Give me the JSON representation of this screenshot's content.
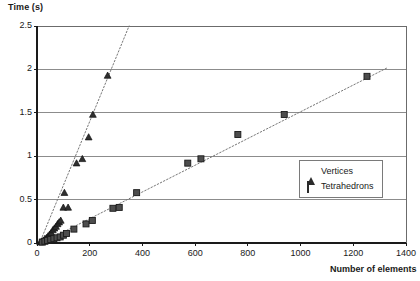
{
  "chart_data": {
    "type": "scatter",
    "title": "",
    "xlabel": "Number of elements",
    "ylabel": "Time (s)",
    "xlim": [
      0,
      1400
    ],
    "ylim": [
      0,
      2.5
    ],
    "xticks": [
      0,
      200,
      400,
      600,
      800,
      1000,
      1200,
      1400
    ],
    "yticks": [
      0,
      0.5,
      1,
      1.5,
      2,
      2.5
    ],
    "xtick_labels": [
      "0",
      "200",
      "400",
      "600",
      "800",
      "1000",
      "1200",
      "1400"
    ],
    "ytick_labels": [
      "0",
      "0.5",
      "1",
      "1.5",
      "2",
      "2.5"
    ],
    "grid": "horizontal",
    "legend_position": "lower-right-inside",
    "series": [
      {
        "name": "Vertices",
        "marker": "triangle",
        "color": "#2b2b2b",
        "trendline": "dotted",
        "trendline_points": [
          [
            10,
            0.0
          ],
          [
            352,
            2.52
          ]
        ],
        "points": [
          [
            12,
            0.01
          ],
          [
            18,
            0.02
          ],
          [
            24,
            0.03
          ],
          [
            30,
            0.05
          ],
          [
            36,
            0.06
          ],
          [
            42,
            0.08
          ],
          [
            48,
            0.1
          ],
          [
            54,
            0.12
          ],
          [
            60,
            0.15
          ],
          [
            66,
            0.17
          ],
          [
            72,
            0.19
          ],
          [
            78,
            0.22
          ],
          [
            84,
            0.24
          ],
          [
            90,
            0.26
          ],
          [
            100,
            0.41
          ],
          [
            118,
            0.41
          ],
          [
            104,
            0.58
          ],
          [
            150,
            0.92
          ],
          [
            172,
            0.97
          ],
          [
            196,
            1.22
          ],
          [
            212,
            1.48
          ],
          [
            268,
            1.93
          ]
        ]
      },
      {
        "name": "Tetrahedrons",
        "marker": "square",
        "color": "#4a4a4a",
        "trendline": "dotted",
        "trendline_points": [
          [
            18,
            0.0
          ],
          [
            1330,
            2.02
          ]
        ],
        "points": [
          [
            20,
            0.01
          ],
          [
            30,
            0.02
          ],
          [
            40,
            0.03
          ],
          [
            52,
            0.04
          ],
          [
            64,
            0.05
          ],
          [
            76,
            0.06
          ],
          [
            88,
            0.07
          ],
          [
            100,
            0.09
          ],
          [
            112,
            0.11
          ],
          [
            140,
            0.16
          ],
          [
            186,
            0.22
          ],
          [
            210,
            0.26
          ],
          [
            288,
            0.4
          ],
          [
            312,
            0.41
          ],
          [
            378,
            0.58
          ],
          [
            572,
            0.92
          ],
          [
            622,
            0.97
          ],
          [
            762,
            1.25
          ],
          [
            938,
            1.48
          ],
          [
            1252,
            1.92
          ]
        ]
      }
    ]
  }
}
